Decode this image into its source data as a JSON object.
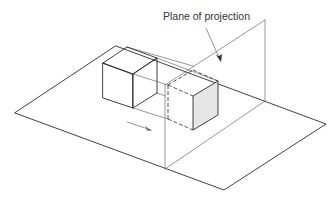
{
  "figure": {
    "label": "Plane of projection",
    "elements": {
      "ground_plane": "ground plane",
      "object": "cube",
      "projection_plane": "plane of projection",
      "projected_face": "shaded projected face",
      "direction_arrow": "direction of projection"
    },
    "colors": {
      "line": "#2b2b2b",
      "thin_line": "#6a6a6a",
      "shaded_face": "#e6e6e6"
    }
  }
}
